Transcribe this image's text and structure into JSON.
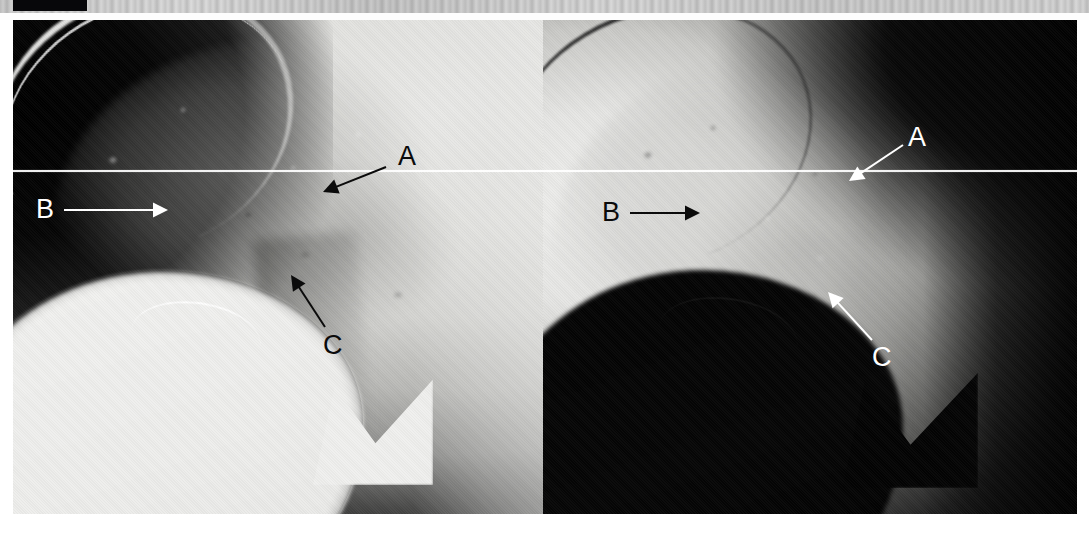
{
  "figure": {
    "kind": "radiograph-pair",
    "caption": "",
    "frame": {
      "left": 13,
      "top": 20,
      "width": 1064,
      "height": 494
    },
    "reference_line": {
      "label": "horizontal-reference-line",
      "y": 150,
      "color": "#ffffff",
      "spans_both_panels": true
    }
  },
  "top_strip": {
    "name": "scan-edge-strip",
    "black_marker_label": "",
    "colors": {
      "strip": "#d4d4d4",
      "marker": "#07070a"
    }
  },
  "panels": [
    {
      "id": "left",
      "name": "left-radiograph-panel",
      "rendering": "standard-density",
      "background_color": "#e3e3e0",
      "dark_region_color": "#0a0a0a",
      "annotations": [
        {
          "id": "A",
          "label": "A",
          "color": "#0b0b0b",
          "label_x": 398,
          "label_y": 143,
          "tail_x": 386,
          "tail_y": 167,
          "head_x": 323,
          "head_y": 192,
          "arrow_style": "solid-triangle"
        },
        {
          "id": "B",
          "label": "B",
          "color": "#ffffff",
          "label_x": 36,
          "label_y": 196,
          "tail_x": 64,
          "tail_y": 210,
          "head_x": 168,
          "head_y": 210,
          "arrow_style": "solid-triangle"
        },
        {
          "id": "C",
          "label": "C",
          "color": "#0b0b0b",
          "label_x": 323,
          "label_y": 332,
          "tail_x": 325,
          "tail_y": 327,
          "head_x": 291,
          "head_y": 275,
          "arrow_style": "solid-triangle"
        }
      ]
    },
    {
      "id": "right",
      "name": "right-radiograph-panel",
      "rendering": "inverted-density",
      "background_color": "#0a0a0a",
      "light_region_color": "#ececea",
      "annotations": [
        {
          "id": "A",
          "label": "A",
          "color": "#ffffff",
          "label_x": 908,
          "label_y": 124,
          "tail_x": 903,
          "tail_y": 145,
          "head_x": 849,
          "head_y": 181,
          "arrow_style": "solid-triangle"
        },
        {
          "id": "B",
          "label": "B",
          "color": "#0b0b0b",
          "label_x": 602,
          "label_y": 199,
          "tail_x": 630,
          "tail_y": 213,
          "head_x": 700,
          "head_y": 213,
          "arrow_style": "solid-triangle"
        },
        {
          "id": "C",
          "label": "C",
          "color": "#ffffff",
          "label_x": 872,
          "label_y": 344,
          "tail_x": 872,
          "tail_y": 340,
          "head_x": 828,
          "head_y": 292,
          "arrow_style": "solid-triangle"
        }
      ]
    }
  ],
  "legend": {
    "items": [
      {
        "key": "A",
        "text": "A"
      },
      {
        "key": "B",
        "text": "B"
      },
      {
        "key": "C",
        "text": "C"
      }
    ]
  }
}
